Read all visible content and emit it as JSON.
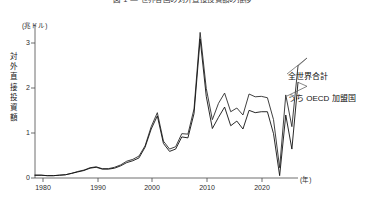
{
  "figure": {
    "title": "図 1 — 世界各国の対外直接投資額の推移",
    "plot_bg": "#ffffff",
    "axis_color": "#4a4a4a"
  },
  "axes": {
    "y_unit": "(兆ドル)",
    "y_axis_title": "対外直接投資額",
    "y_ticks": [
      "0",
      "1",
      "2",
      "3"
    ],
    "x_unit": "(年)",
    "x_ticks": [
      "1980",
      "1990",
      "2000",
      "2010",
      "2020"
    ]
  },
  "legend": {
    "world": "全世界合計",
    "oecd": "うち OECD 加盟国"
  },
  "chart_data": {
    "type": "line",
    "title": "図 1 — 世界各国の対外直接投資額の推移",
    "xlabel": "(年)",
    "ylabel": "対外直接投資額",
    "y_unit": "兆ドル",
    "xlim": [
      1980,
      2023
    ],
    "ylim": [
      0,
      3.3
    ],
    "grid": false,
    "legend_position": "right-inline",
    "x": [
      1980,
      1981,
      1982,
      1983,
      1984,
      1985,
      1986,
      1987,
      1988,
      1989,
      1990,
      1991,
      1992,
      1993,
      1994,
      1995,
      1996,
      1997,
      1998,
      1999,
      2000,
      2001,
      2002,
      2003,
      2004,
      2005,
      2006,
      2007,
      2008,
      2009,
      2010,
      2011,
      2012,
      2013,
      2014,
      2015,
      2016,
      2017,
      2018,
      2019,
      2020,
      2021,
      2022,
      2023
    ],
    "series": [
      {
        "name": "全世界合計",
        "color": "#2b2b2b",
        "values": [
          0.06,
          0.06,
          0.05,
          0.05,
          0.06,
          0.07,
          0.1,
          0.14,
          0.17,
          0.22,
          0.24,
          0.2,
          0.2,
          0.23,
          0.28,
          0.36,
          0.4,
          0.47,
          0.69,
          1.1,
          1.4,
          0.79,
          0.62,
          0.67,
          0.95,
          0.94,
          1.48,
          3.12,
          1.92,
          1.25,
          1.6,
          1.82,
          1.42,
          1.5,
          1.35,
          1.8,
          1.74,
          1.75,
          1.72,
          1.25,
          0.22,
          1.78,
          1.1,
          2.4
        ]
      },
      {
        "name": "うち OECD 加盟国",
        "color": "#111111",
        "values": [
          0.06,
          0.06,
          0.05,
          0.05,
          0.06,
          0.07,
          0.1,
          0.13,
          0.16,
          0.21,
          0.23,
          0.19,
          0.19,
          0.21,
          0.26,
          0.33,
          0.37,
          0.43,
          0.66,
          1.05,
          1.33,
          0.74,
          0.57,
          0.62,
          0.88,
          0.86,
          1.38,
          2.98,
          1.75,
          1.06,
          1.3,
          1.52,
          1.12,
          1.22,
          1.05,
          1.45,
          1.4,
          1.42,
          1.42,
          0.95,
          0.05,
          1.35,
          0.62,
          2.05
        ]
      }
    ],
    "annotations": [
      {
        "text": "全世界合計",
        "x": 2023,
        "y": 2.4
      },
      {
        "text": "うち OECD 加盟国",
        "x": 2023,
        "y": 2.05
      }
    ]
  }
}
